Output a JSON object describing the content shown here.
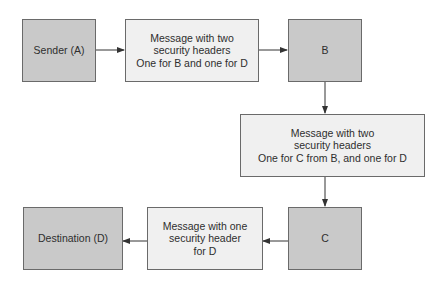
{
  "diagram": {
    "nodes": [
      {
        "id": "A",
        "label": "Sender (A)",
        "type": "endpoint"
      },
      {
        "id": "msg1",
        "label": "Message with two\nsecurity headers\nOne for B and one for D",
        "type": "message"
      },
      {
        "id": "B",
        "label": "B",
        "type": "endpoint"
      },
      {
        "id": "msg2",
        "label": "Message with two\nsecurity headers\nOne for C from B, and one for D",
        "type": "message"
      },
      {
        "id": "C",
        "label": "C",
        "type": "endpoint"
      },
      {
        "id": "msg3",
        "label": "Message with one\nsecurity header\nfor D",
        "type": "message"
      },
      {
        "id": "D",
        "label": "Destination (D)",
        "type": "endpoint"
      }
    ],
    "edges": [
      {
        "from": "A",
        "to": "msg1"
      },
      {
        "from": "msg1",
        "to": "B"
      },
      {
        "from": "B",
        "to": "msg2"
      },
      {
        "from": "msg2",
        "to": "C"
      },
      {
        "from": "C",
        "to": "msg3"
      },
      {
        "from": "msg3",
        "to": "D"
      }
    ],
    "colors": {
      "endpoint_fill": "#c9c9c9",
      "message_fill": "#f0f0f0",
      "border": "#6a6a6a",
      "arrow": "#333333"
    }
  }
}
